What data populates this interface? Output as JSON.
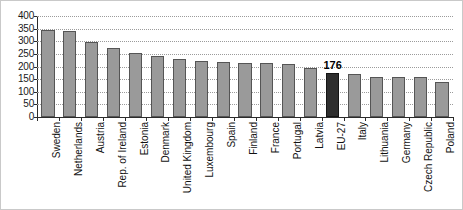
{
  "chart_data": {
    "type": "bar",
    "title": "",
    "subtitle": "",
    "xlabel": "",
    "ylabel": "",
    "ylim": [
      0,
      400
    ],
    "yticks": [
      0,
      50,
      100,
      150,
      200,
      250,
      300,
      350,
      400
    ],
    "grid": true,
    "legend": "none",
    "categories": [
      "Sweden",
      "Netherlands",
      "Austria",
      "Rep. of Ireland",
      "Estonia",
      "Denmark",
      "United Kingdom",
      "Luxembourg",
      "Spain",
      "Finland",
      "France",
      "Portugal",
      "Latvia",
      "EU-27",
      "Italy",
      "Lithuania",
      "Germany",
      "Czech Republic",
      "Poland"
    ],
    "values": [
      345,
      340,
      298,
      273,
      252,
      240,
      228,
      222,
      216,
      215,
      212,
      210,
      196,
      176,
      172,
      160,
      158,
      160,
      140
    ],
    "data_labels": [
      null,
      null,
      null,
      null,
      null,
      null,
      null,
      null,
      null,
      null,
      null,
      null,
      null,
      "176",
      null,
      null,
      null,
      null,
      null
    ],
    "highlight_index": 13,
    "colors": {
      "bar_fill": "#9a9a9a",
      "bar_stroke": "#555555",
      "highlight_fill": "#2e2e2e",
      "highlight_stroke": "#141414",
      "gridline": "#9b9b9b",
      "axis": "#2b2b2b",
      "background": "#ffffff",
      "text": "#111111"
    }
  }
}
